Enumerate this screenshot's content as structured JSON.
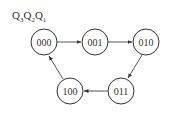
{
  "diagram": {
    "type": "state-transition",
    "label": {
      "parts": [
        "Q",
        "3",
        "Q",
        "2",
        "Q",
        "1"
      ]
    },
    "states": [
      {
        "id": "s0",
        "label": "000",
        "cx": 44,
        "cy": 42
      },
      {
        "id": "s1",
        "label": "001",
        "cx": 95,
        "cy": 42
      },
      {
        "id": "s2",
        "label": "010",
        "cx": 146,
        "cy": 42
      },
      {
        "id": "s3",
        "label": "011",
        "cx": 121,
        "cy": 91
      },
      {
        "id": "s4",
        "label": "100",
        "cx": 70,
        "cy": 91
      }
    ],
    "transitions": [
      {
        "from": "000",
        "to": "001"
      },
      {
        "from": "001",
        "to": "010"
      },
      {
        "from": "010",
        "to": "011"
      },
      {
        "from": "011",
        "to": "100"
      },
      {
        "from": "100",
        "to": "000"
      }
    ]
  }
}
